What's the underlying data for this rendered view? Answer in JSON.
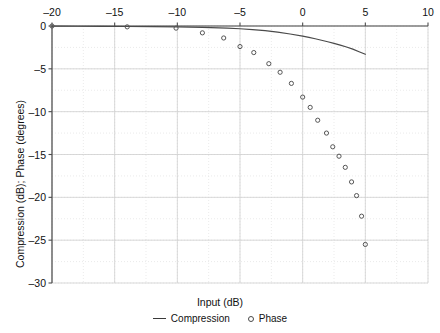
{
  "chart_data": {
    "type": "scatter",
    "title": "",
    "xlabel": "Input (dB)",
    "ylabel": "Compression (dB); Phase (degrees)",
    "xlim": [
      -20,
      10
    ],
    "ylim": [
      -30,
      0
    ],
    "xticks": [
      -20,
      -15,
      -10,
      -5,
      0,
      5,
      10
    ],
    "yticks": [
      0,
      -5,
      -10,
      -15,
      -20,
      -25,
      -30
    ],
    "xtick_labels": [
      "–20",
      "–15",
      "–10",
      "–5",
      "0",
      "5",
      "10"
    ],
    "ytick_labels": [
      "0",
      "–5",
      "–10",
      "–15",
      "–20",
      "–25",
      "–30"
    ],
    "grid": true,
    "legend_position": "below",
    "series": [
      {
        "name": "Compression",
        "type": "line",
        "color": "#4a4a4a",
        "x": [
          -20,
          -18,
          -16,
          -14,
          -12,
          -10,
          -8,
          -6,
          -5,
          -4,
          -3,
          -2,
          -1,
          0,
          0.5,
          1,
          1.5,
          2,
          2.5,
          3,
          3.5,
          4,
          4.5,
          5
        ],
        "y": [
          -0.02,
          -0.03,
          -0.04,
          -0.06,
          -0.08,
          -0.11,
          -0.16,
          -0.25,
          -0.32,
          -0.42,
          -0.55,
          -0.72,
          -0.93,
          -1.18,
          -1.33,
          -1.49,
          -1.66,
          -1.84,
          -2.03,
          -2.23,
          -2.45,
          -2.7,
          -3.0,
          -3.3
        ]
      },
      {
        "name": "Phase",
        "type": "scatter",
        "color": "#4a4a4a",
        "x": [
          -20,
          -14,
          -10,
          -8,
          -6,
          -5,
          -4,
          -3,
          -2,
          -1,
          0,
          0.4,
          1,
          1.4,
          2,
          2.4,
          3,
          3.4,
          4,
          4.5,
          5,
          5
        ],
        "y": [
          0,
          -0.1,
          -0.25,
          -0.8,
          -1.4,
          -2.4,
          -3.1,
          -4.4,
          -5.4,
          -6.7,
          -8.3,
          -9.5,
          -11.0,
          -12.5,
          -14.1,
          -15.2,
          -16.5,
          -18.2,
          -19.8,
          -22.2,
          -25.5,
          -25.5
        ]
      }
    ],
    "points": {
      "compression": [
        {
          "x": -20,
          "y": -0.02
        },
        {
          "x": -15,
          "y": -0.04
        },
        {
          "x": -10,
          "y": -0.11
        },
        {
          "x": -5,
          "y": -0.32
        },
        {
          "x": 0,
          "y": -1.18
        },
        {
          "x": 5,
          "y": -3.3
        }
      ],
      "phase": [
        {
          "x": -20,
          "y": 0.0
        },
        {
          "x": -14.0,
          "y": -0.1
        },
        {
          "x": -10.1,
          "y": -0.25
        },
        {
          "x": -8.0,
          "y": -0.8
        },
        {
          "x": -6.3,
          "y": -1.4
        },
        {
          "x": -5.0,
          "y": -2.4
        },
        {
          "x": -3.9,
          "y": -3.1
        },
        {
          "x": -2.7,
          "y": -4.4
        },
        {
          "x": -1.8,
          "y": -5.4
        },
        {
          "x": -0.9,
          "y": -6.7
        },
        {
          "x": 0.0,
          "y": -8.3
        },
        {
          "x": 0.6,
          "y": -9.5
        },
        {
          "x": 1.2,
          "y": -11.0
        },
        {
          "x": 1.9,
          "y": -12.5
        },
        {
          "x": 2.4,
          "y": -14.1
        },
        {
          "x": 2.9,
          "y": -15.2
        },
        {
          "x": 3.4,
          "y": -16.5
        },
        {
          "x": 3.9,
          "y": -18.2
        },
        {
          "x": 4.3,
          "y": -19.8
        },
        {
          "x": 4.7,
          "y": -22.2
        },
        {
          "x": 5.0,
          "y": -25.5
        }
      ]
    }
  },
  "legend": {
    "entries": [
      {
        "label": "Compression",
        "marker": "line"
      },
      {
        "label": "Phase",
        "marker": "circle"
      }
    ]
  },
  "colors": {
    "axis": "#4d4d4d",
    "grid": "#cfcfcf",
    "grid_minor": "#e2e2e2",
    "curve": "#4a4a4a",
    "marker": "#555555",
    "text": "#111111",
    "background": "#ffffff"
  }
}
